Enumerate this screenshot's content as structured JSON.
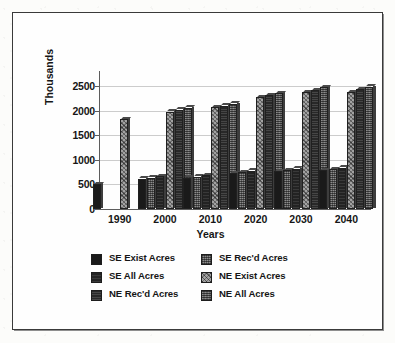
{
  "chart_data": {
    "type": "bar",
    "title": "",
    "xlabel": "Years",
    "ylabel": "Thousands",
    "categories": [
      "1990",
      "2000",
      "2010",
      "2020",
      "2030",
      "2040"
    ],
    "ylim": [
      0,
      2500
    ],
    "yticks": [
      0,
      500,
      1000,
      1500,
      2000,
      2500
    ],
    "ytick_labels": [
      "0",
      "500",
      "1000",
      "1500",
      "2000",
      "2500"
    ],
    "grid": true,
    "legend_position": "below",
    "series": [
      {
        "name": "SE Exist Acres",
        "pattern": "solid-black",
        "values": [
          500,
          620,
          640,
          730,
          770,
          790
        ]
      },
      {
        "name": "SE Rec'd Acres",
        "pattern": "dithered-light",
        "values": [
          null,
          640,
          660,
          750,
          790,
          810
        ]
      },
      {
        "name": "SE All Acres",
        "pattern": "solid-dark-lines",
        "values": [
          null,
          670,
          690,
          780,
          820,
          840
        ]
      },
      {
        "name": "NE Exist Acres",
        "pattern": "dithered-mid",
        "values": [
          1820,
          1980,
          2070,
          2270,
          2370,
          2380
        ]
      },
      {
        "name": "NE Rec'd Acres",
        "pattern": "solid-dense-lines",
        "values": [
          null,
          2020,
          2100,
          2310,
          2420,
          2430
        ]
      },
      {
        "name": "NE All Acres",
        "pattern": "dithered-dark",
        "values": [
          null,
          2060,
          2140,
          2350,
          2470,
          2490
        ]
      }
    ]
  },
  "axes": {
    "y_title": "Thousands",
    "x_title": "Years"
  },
  "legend": {
    "left_column": [
      {
        "label": "SE Exist Acres",
        "swatch": "solid-black"
      },
      {
        "label": "SE All Acres",
        "swatch": "solid-dark-lines"
      },
      {
        "label": "NE Rec'd Acres",
        "swatch": "solid-dense-lines"
      }
    ],
    "right_column": [
      {
        "label": "SE Rec'd Acres",
        "swatch": "dithered-light"
      },
      {
        "label": "NE Exist Acres",
        "swatch": "dithered-mid"
      },
      {
        "label": "NE All Acres",
        "swatch": "dithered-dark"
      }
    ]
  },
  "colors": {
    "frame": "#3a3a3a",
    "axis": "#5c5c5c",
    "grid": "#b9b9b9",
    "text": "#161616",
    "background": "#fefefe"
  }
}
